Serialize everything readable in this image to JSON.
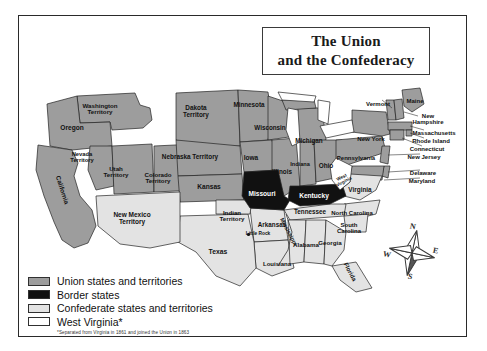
{
  "title": {
    "line1": "The Union",
    "line2": "and the Confederacy"
  },
  "colors": {
    "union": "#9d9d9d",
    "border_state": "#111111",
    "confederate": "#e3e3e3",
    "west_virginia": "#ffffff",
    "outline": "#222222",
    "frame": "#2a2a2a",
    "water": "#ffffff"
  },
  "legend": {
    "items": [
      {
        "swatch": "#9d9d9d",
        "label": "Union states and territories"
      },
      {
        "swatch": "#111111",
        "label": "Border states"
      },
      {
        "swatch": "#e3e3e3",
        "label": "Confederate states and territories"
      },
      {
        "swatch": "#ffffff",
        "label": "West Virginia*"
      }
    ],
    "note": "*Separated from Virginia in 1861 and joined the Union in 1863"
  },
  "compass": {
    "n": "N",
    "e": "E",
    "s": "S",
    "w": "W",
    "icon": "compass-rose-icon"
  },
  "cities": [
    {
      "name": "Little Rock",
      "x": 247,
      "y": 233
    }
  ],
  "rivers": [
    {
      "name": "Mississippi",
      "x": 288,
      "y": 232,
      "rotation": 62
    }
  ],
  "map_labels": [
    {
      "name": "Washington\nTerritory",
      "x": 100,
      "y": 109,
      "size": 6.2,
      "color": "#111",
      "rot": 0
    },
    {
      "name": "Oregon",
      "x": 72,
      "y": 128,
      "size": 6.6,
      "color": "#111",
      "rot": 0
    },
    {
      "name": "Nevada\nTerritory",
      "x": 82,
      "y": 158,
      "size": 5.8,
      "color": "#111",
      "rot": 0
    },
    {
      "name": "Utah\nTerritory",
      "x": 116,
      "y": 172,
      "size": 6.2,
      "color": "#111",
      "rot": 0
    },
    {
      "name": "California",
      "x": 62,
      "y": 190,
      "size": 6.4,
      "color": "#111",
      "rot": 72
    },
    {
      "name": "Colorado\nTerritory",
      "x": 158,
      "y": 178,
      "size": 6.2,
      "color": "#111",
      "rot": 0
    },
    {
      "name": "Dakota\nTerritory",
      "x": 196,
      "y": 112,
      "size": 6.4,
      "color": "#111",
      "rot": 0
    },
    {
      "name": "Nebraska Territory",
      "x": 190,
      "y": 157,
      "size": 6.4,
      "color": "#111",
      "rot": 0
    },
    {
      "name": "Kansas",
      "x": 209,
      "y": 187,
      "size": 6.6,
      "color": "#111",
      "rot": 0
    },
    {
      "name": "Minnesota",
      "x": 249,
      "y": 105,
      "size": 6.3,
      "color": "#111",
      "rot": 0
    },
    {
      "name": "Wisconsin",
      "x": 270,
      "y": 128,
      "size": 6.3,
      "color": "#111",
      "rot": 0
    },
    {
      "name": "Iowa",
      "x": 251,
      "y": 158,
      "size": 6.5,
      "color": "#111",
      "rot": 0
    },
    {
      "name": "Illinois",
      "x": 282,
      "y": 172,
      "size": 6.3,
      "color": "#111",
      "rot": 0
    },
    {
      "name": "Michigan",
      "x": 309,
      "y": 141,
      "size": 6.3,
      "color": "#111",
      "rot": 0
    },
    {
      "name": "Indiana",
      "x": 300,
      "y": 165,
      "size": 5.6,
      "color": "#111",
      "rot": 0
    },
    {
      "name": "Ohio",
      "x": 326,
      "y": 166,
      "size": 6.4,
      "color": "#111",
      "rot": 0
    },
    {
      "name": "Missouri",
      "x": 262,
      "y": 194,
      "size": 6.6,
      "color": "#ffffff",
      "rot": 0
    },
    {
      "name": "Kentucky",
      "x": 314,
      "y": 196,
      "size": 6.6,
      "color": "#ffffff",
      "rot": 0
    },
    {
      "name": "Tennessee",
      "x": 310,
      "y": 212,
      "size": 6.3,
      "color": "#111",
      "rot": 0
    },
    {
      "name": "Arkansas",
      "x": 272,
      "y": 225,
      "size": 6.3,
      "color": "#111",
      "rot": 0
    },
    {
      "name": "Little Rock",
      "x": 258,
      "y": 234,
      "size": 4.8,
      "color": "#111",
      "rot": 0
    },
    {
      "name": "Indian\nTerritory",
      "x": 232,
      "y": 216,
      "size": 6.2,
      "color": "#111",
      "rot": 0
    },
    {
      "name": "Texas",
      "x": 218,
      "y": 252,
      "size": 6.8,
      "color": "#111",
      "rot": 0
    },
    {
      "name": "Louisiana",
      "x": 277,
      "y": 264,
      "size": 6.0,
      "color": "#111",
      "rot": 0
    },
    {
      "name": "New Mexico\nTerritory",
      "x": 132,
      "y": 219,
      "size": 6.5,
      "color": "#111",
      "rot": 0
    },
    {
      "name": "Mississippi",
      "x": 288,
      "y": 232,
      "size": 5.6,
      "color": "#111",
      "rot": 62
    },
    {
      "name": "Alabama",
      "x": 306,
      "y": 245,
      "size": 6.2,
      "color": "#111",
      "rot": 0
    },
    {
      "name": "Georgia",
      "x": 330,
      "y": 243,
      "size": 6.2,
      "color": "#111",
      "rot": 0
    },
    {
      "name": "Florida",
      "x": 350,
      "y": 272,
      "size": 6.0,
      "color": "#111",
      "rot": 62
    },
    {
      "name": "North Carolina",
      "x": 352,
      "y": 213,
      "size": 6.0,
      "color": "#111",
      "rot": 0
    },
    {
      "name": "South\nCarolina",
      "x": 349,
      "y": 228,
      "size": 6.0,
      "color": "#111",
      "rot": 0
    },
    {
      "name": "Virginia",
      "x": 360,
      "y": 190,
      "size": 6.4,
      "color": "#111",
      "rot": 0
    },
    {
      "name": "West\nVirginia",
      "x": 343,
      "y": 180,
      "size": 4.6,
      "color": "#111",
      "rot": -28
    },
    {
      "name": "Pennsylvania",
      "x": 356,
      "y": 158,
      "size": 6.0,
      "color": "#111",
      "rot": 0
    },
    {
      "name": "New York",
      "x": 371,
      "y": 139,
      "size": 6.2,
      "color": "#111",
      "rot": 0
    },
    {
      "name": "Vermont",
      "x": 378,
      "y": 104,
      "size": 6.0,
      "color": "#111",
      "rot": 0
    },
    {
      "name": "Maine",
      "x": 415,
      "y": 101,
      "size": 6.0,
      "color": "#111",
      "rot": 0
    },
    {
      "name": "New\nHampshire",
      "x": 428,
      "y": 119,
      "size": 6.0,
      "color": "#111",
      "rot": 0
    },
    {
      "name": "Massachusetts",
      "x": 434,
      "y": 133,
      "size": 6.0,
      "color": "#111",
      "rot": 0
    },
    {
      "name": "Rhode Island",
      "x": 431,
      "y": 141,
      "size": 6.0,
      "color": "#111",
      "rot": 0
    },
    {
      "name": "Connecticut",
      "x": 427,
      "y": 149,
      "size": 6.0,
      "color": "#111",
      "rot": 0
    },
    {
      "name": "New Jersey",
      "x": 424,
      "y": 157,
      "size": 6.0,
      "color": "#111",
      "rot": 0
    },
    {
      "name": "Delaware",
      "x": 423,
      "y": 173,
      "size": 6.0,
      "color": "#111",
      "rot": 0
    },
    {
      "name": "Maryland",
      "x": 422,
      "y": 181,
      "size": 6.0,
      "color": "#111",
      "rot": 0
    }
  ]
}
